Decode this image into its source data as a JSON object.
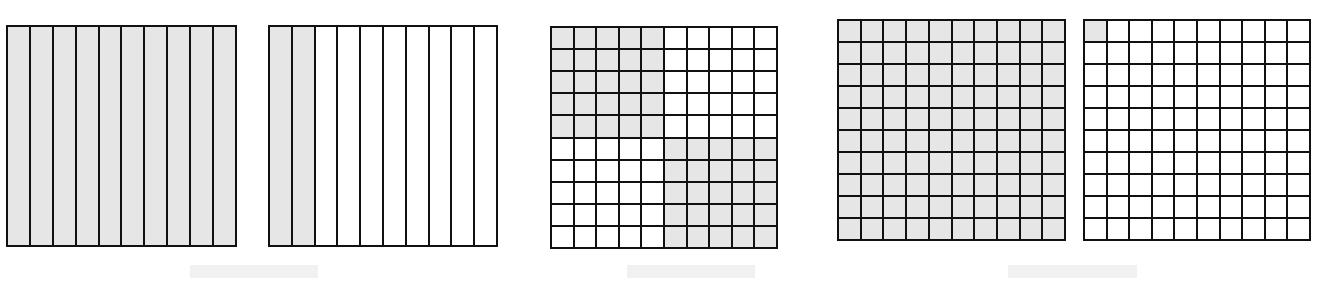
{
  "header": {
    "title_text": ""
  },
  "colors": {
    "shaded": "#e6e6e6",
    "unshaded": "#ffffff",
    "line": "#111111",
    "caption_placeholder": "#f1f1f1"
  },
  "models": [
    {
      "id": "model-1",
      "kind": "strips",
      "rows": 1,
      "cols": 10,
      "shaded_count": 10,
      "total": 10,
      "shaded_cells": "all"
    },
    {
      "id": "model-2",
      "kind": "strips",
      "rows": 1,
      "cols": 10,
      "shaded_count": 2,
      "total": 10,
      "shaded_cells": "first-2-columns"
    },
    {
      "id": "model-3",
      "kind": "hundred-grid",
      "rows": 10,
      "cols": 10,
      "shaded_count": 50,
      "total": 100,
      "shaded_cells": "top-left-5x5-and-bottom-right-5x5"
    },
    {
      "id": "model-4",
      "kind": "hundred-grid",
      "rows": 10,
      "cols": 10,
      "shaded_count": 100,
      "total": 100,
      "shaded_cells": "all"
    },
    {
      "id": "model-5",
      "kind": "hundred-grid",
      "rows": 10,
      "cols": 10,
      "shaded_count": 1,
      "total": 100,
      "shaded_cells": "top-left-1"
    }
  ],
  "captions": [
    {
      "text": ""
    },
    {
      "text": ""
    },
    {
      "text": ""
    }
  ]
}
